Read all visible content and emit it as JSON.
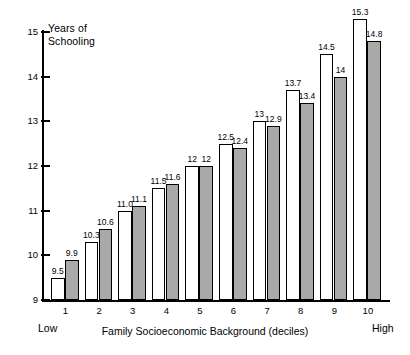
{
  "chart_data": {
    "type": "bar",
    "title": "",
    "ylabel": "Years of\nSchooling",
    "xlabel": "Family Socioeconomic Background (deciles)",
    "categories": [
      "1",
      "2",
      "3",
      "4",
      "5",
      "6",
      "7",
      "8",
      "9",
      "10"
    ],
    "series": [
      {
        "name": "white-bar",
        "fill": "#ffffff",
        "values": [
          9.5,
          10.3,
          11.0,
          11.5,
          12,
          12.5,
          13,
          13.7,
          14.5,
          15.3
        ],
        "labels": [
          "9.5",
          "10.3",
          "11.0",
          "11.5",
          "12",
          "12.5",
          "13",
          "13.7",
          "14.5",
          "15.3"
        ]
      },
      {
        "name": "gray-bar",
        "fill": "#a9a9a9",
        "values": [
          9.9,
          10.6,
          11.1,
          11.6,
          12,
          12.4,
          12.9,
          13.4,
          14,
          14.8
        ],
        "labels": [
          "9.9",
          "10.6",
          "11.1",
          "11.6",
          "12",
          "12.4",
          "12.9",
          "13.4",
          "14",
          "14.8"
        ]
      }
    ],
    "ylim": [
      9,
      15
    ],
    "yticks": [
      "9",
      "10",
      "11",
      "12",
      "13",
      "14",
      "15"
    ],
    "grid": false,
    "legend": "none",
    "annotations": {
      "low": "Low",
      "high": "High"
    }
  },
  "axis": {
    "y_title": "Years of\nSchooling",
    "x_title": "Family Socioeconomic Background (deciles)",
    "low_label": "Low",
    "high_label": "High"
  }
}
